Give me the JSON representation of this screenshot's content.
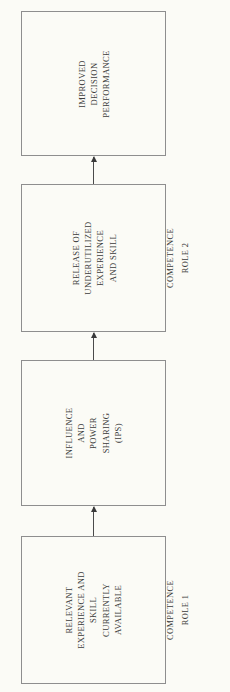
{
  "diagram": {
    "orientation": "rotated-90-ccw",
    "background_color": "#fbfbf6",
    "box_border_color": "#8e8e8e",
    "text_color": "#3b3b3b",
    "arrow_color": "#3a3a3a",
    "nodes": [
      {
        "id": "improved-decision-performance",
        "lines": [
          "IMPROVED",
          "DECISION",
          "PERFORMANCE"
        ]
      },
      {
        "id": "release-of-underutilized-experience-and-skill",
        "lines": [
          "RELEASE OF",
          "UNDERUTILIZED",
          "EXPERIENCE",
          "AND SKILL"
        ]
      },
      {
        "id": "influence-and-power-sharing",
        "lines": [
          "INFLUENCE",
          "AND",
          "POWER",
          "SHARING",
          "(IPS)"
        ]
      },
      {
        "id": "relevant-experience-and-skill-currently-available",
        "lines": [
          "RELEVANT",
          "EXPERIENCE AND",
          "SKILL",
          "CURRENTLY",
          "AVAILABLE"
        ]
      }
    ],
    "captions": [
      {
        "id": "competence-role-2",
        "lines": [
          "COMPETENCE",
          "ROLE 2"
        ]
      },
      {
        "id": "competence-role-1",
        "lines": [
          "COMPETENCE",
          "ROLE 1"
        ]
      }
    ],
    "connectors": [
      {
        "id": "arrow-role1-to-ips",
        "direction": "up"
      },
      {
        "id": "arrow-ips-to-release",
        "direction": "up"
      },
      {
        "id": "arrow-release-to-improved",
        "direction": "up"
      }
    ]
  }
}
